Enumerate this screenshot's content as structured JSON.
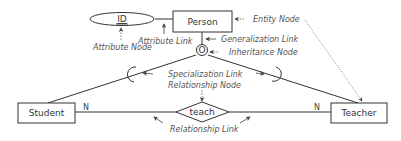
{
  "diagram": {
    "type": "er-diagram",
    "entities": [
      {
        "id": "person",
        "label": "Person"
      },
      {
        "id": "student",
        "label": "Student"
      },
      {
        "id": "teacher",
        "label": "Teacher"
      }
    ],
    "attributes": [
      {
        "id": "id",
        "label": "ID",
        "key": true,
        "of": "person"
      }
    ],
    "inheritance_node": {
      "symbol": "O"
    },
    "relationships": [
      {
        "id": "teach",
        "label": "teach",
        "student_cardinality": "N",
        "teacher_cardinality": "N"
      }
    ],
    "annotations": {
      "entity_node": "Entity Node",
      "attribute_link": "Attribute Link",
      "attribute_node": "Attribute Node",
      "generalization_link": "Generalization Link",
      "inheritance_node": "Inheritance Node",
      "specialization_link": "Specialization Link",
      "relationship_node": "Relationship Node",
      "relationship_link": "Relationship Link"
    },
    "colors": {
      "stroke": "#333333",
      "annotation": "#555555",
      "background": "#ffffff"
    }
  }
}
